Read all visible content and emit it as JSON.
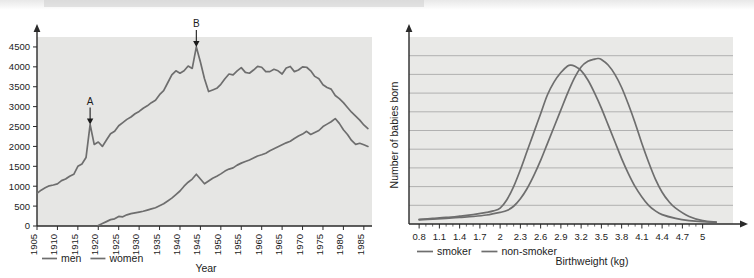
{
  "figure": {
    "name": "two-scanned-line-charts",
    "background_color": "#ffffff",
    "plot_background_color": "#e6e6e4",
    "line_color": "#6e6e6e",
    "grid_color": "#9a9a9a",
    "axis_color": "#2a2a2a"
  },
  "chart_data": [
    {
      "type": "line",
      "name": "deaths-by-year-chart",
      "title": "",
      "xlabel": "Year",
      "ylabel": "",
      "xlim": [
        1905,
        1987
      ],
      "ylim": [
        0,
        4750
      ],
      "grid": false,
      "legend_position": "bottom-left",
      "xticks": [
        1905,
        1910,
        1915,
        1920,
        1925,
        1930,
        1935,
        1940,
        1945,
        1950,
        1955,
        1960,
        1965,
        1970,
        1975,
        1980,
        1985
      ],
      "xtick_labels": [
        "1905",
        "1910",
        "1915",
        "1920",
        "1925",
        "1930",
        "1935",
        "1940",
        "1945",
        "1950",
        "1955",
        "1960",
        "1965",
        "1970",
        "1975",
        "1980",
        "1985"
      ],
      "yticks": [
        0,
        500,
        1000,
        1500,
        2000,
        2500,
        3000,
        3500,
        4000,
        4500
      ],
      "ytick_labels": [
        "0",
        "500",
        "1000",
        "1500",
        "2000",
        "2500",
        "3000",
        "3500",
        "4000",
        "4500"
      ],
      "annotations": [
        {
          "label": "A",
          "x": 1918,
          "y": 2550
        },
        {
          "label": "B",
          "x": 1944,
          "y": 4500
        }
      ],
      "series": [
        {
          "name": "men",
          "legend_label": "men",
          "x": [
            1905,
            1906,
            1907,
            1908,
            1909,
            1910,
            1911,
            1912,
            1913,
            1914,
            1915,
            1916,
            1917,
            1918,
            1919,
            1920,
            1921,
            1922,
            1923,
            1924,
            1925,
            1926,
            1927,
            1928,
            1929,
            1930,
            1931,
            1932,
            1933,
            1934,
            1935,
            1936,
            1937,
            1938,
            1939,
            1940,
            1941,
            1942,
            1943,
            1944,
            1945,
            1946,
            1947,
            1948,
            1949,
            1950,
            1951,
            1952,
            1953,
            1954,
            1955,
            1956,
            1957,
            1958,
            1959,
            1960,
            1961,
            1962,
            1963,
            1964,
            1965,
            1966,
            1967,
            1968,
            1969,
            1970,
            1971,
            1972,
            1973,
            1974,
            1975,
            1976,
            1977,
            1978,
            1979,
            1980,
            1981,
            1982,
            1983,
            1984,
            1985,
            1986
          ],
          "y": [
            820,
            900,
            960,
            1010,
            1030,
            1060,
            1140,
            1180,
            1250,
            1300,
            1500,
            1560,
            1720,
            2550,
            2050,
            2110,
            2000,
            2160,
            2320,
            2380,
            2520,
            2600,
            2680,
            2740,
            2820,
            2880,
            2960,
            3020,
            3100,
            3160,
            3300,
            3400,
            3600,
            3800,
            3900,
            3840,
            3900,
            4020,
            3960,
            4500,
            4120,
            3700,
            3380,
            3420,
            3460,
            3560,
            3700,
            3820,
            3800,
            3900,
            3980,
            3860,
            3840,
            3920,
            4010,
            3990,
            3880,
            3880,
            3940,
            3900,
            3820,
            3970,
            4010,
            3880,
            3920,
            4000,
            3990,
            3900,
            3760,
            3700,
            3550,
            3480,
            3440,
            3280,
            3200,
            3100,
            2980,
            2860,
            2760,
            2660,
            2540,
            2450
          ]
        },
        {
          "name": "women",
          "legend_label": "women",
          "x": [
            1920,
            1921,
            1922,
            1923,
            1924,
            1925,
            1926,
            1927,
            1928,
            1929,
            1930,
            1931,
            1932,
            1933,
            1934,
            1935,
            1936,
            1937,
            1938,
            1939,
            1940,
            1941,
            1942,
            1943,
            1944,
            1945,
            1946,
            1947,
            1948,
            1949,
            1950,
            1951,
            1952,
            1953,
            1954,
            1955,
            1956,
            1957,
            1958,
            1959,
            1960,
            1961,
            1962,
            1963,
            1964,
            1965,
            1966,
            1967,
            1968,
            1969,
            1970,
            1971,
            1972,
            1973,
            1974,
            1975,
            1976,
            1977,
            1978,
            1979,
            1980,
            1981,
            1982,
            1983,
            1984,
            1985,
            1986
          ],
          "y": [
            10,
            60,
            110,
            160,
            180,
            240,
            230,
            280,
            310,
            330,
            350,
            370,
            400,
            430,
            460,
            510,
            560,
            630,
            700,
            790,
            880,
            1000,
            1100,
            1180,
            1300,
            1180,
            1060,
            1130,
            1200,
            1250,
            1310,
            1380,
            1430,
            1460,
            1530,
            1580,
            1620,
            1660,
            1710,
            1760,
            1790,
            1830,
            1890,
            1940,
            1990,
            2040,
            2090,
            2130,
            2200,
            2260,
            2310,
            2380,
            2300,
            2350,
            2400,
            2500,
            2560,
            2620,
            2700,
            2580,
            2420,
            2300,
            2150,
            2050,
            2080,
            2040,
            2000
          ]
        }
      ]
    },
    {
      "type": "line",
      "name": "birthweight-distribution-chart",
      "title": "",
      "xlabel": "Birthweight (kg)",
      "ylabel": "Number of babies born",
      "xlim": [
        0.65,
        5.45
      ],
      "ylim": [
        0,
        10
      ],
      "grid": true,
      "gridline_count": 9,
      "legend_position": "bottom-left",
      "xticks": [
        0.8,
        1.1,
        1.4,
        1.7,
        2,
        2.3,
        2.6,
        2.9,
        3.2,
        3.5,
        3.8,
        4.1,
        4.4,
        4.7,
        5
      ],
      "xtick_labels": [
        "0.8",
        "1.1",
        "1.4",
        "1.7",
        "2",
        "2.3",
        "2.6",
        "2.9",
        "3.2",
        "3.5",
        "3.8",
        "4.1",
        "4.4",
        "4.7",
        "5"
      ],
      "yticks": [],
      "ytick_labels": [],
      "series": [
        {
          "name": "smoker",
          "legend_label": "smoker",
          "peak_x": 3.05,
          "x": [
            0.8,
            1.0,
            1.2,
            1.4,
            1.6,
            1.8,
            1.9,
            2.0,
            2.1,
            2.2,
            2.3,
            2.4,
            2.5,
            2.6,
            2.7,
            2.8,
            2.9,
            3.0,
            3.05,
            3.1,
            3.2,
            3.3,
            3.4,
            3.5,
            3.6,
            3.7,
            3.8,
            3.9,
            4.0,
            4.1,
            4.2,
            4.3,
            4.4,
            4.6,
            4.8,
            5.0,
            5.2
          ],
          "y": [
            0.25,
            0.3,
            0.35,
            0.42,
            0.5,
            0.62,
            0.7,
            0.85,
            1.3,
            2.0,
            2.9,
            3.9,
            4.9,
            5.9,
            6.9,
            7.6,
            8.1,
            8.45,
            8.5,
            8.45,
            8.2,
            7.7,
            7.0,
            6.2,
            5.3,
            4.4,
            3.5,
            2.7,
            2.0,
            1.45,
            1.0,
            0.7,
            0.5,
            0.3,
            0.18,
            0.12,
            0.1
          ]
        },
        {
          "name": "non-smoker",
          "legend_label": "non-smoker",
          "peak_x": 3.42,
          "x": [
            0.8,
            1.0,
            1.2,
            1.4,
            1.6,
            1.8,
            2.0,
            2.1,
            2.2,
            2.3,
            2.4,
            2.5,
            2.6,
            2.7,
            2.8,
            2.9,
            3.0,
            3.1,
            3.2,
            3.3,
            3.4,
            3.45,
            3.5,
            3.6,
            3.7,
            3.8,
            3.9,
            4.0,
            4.1,
            4.2,
            4.3,
            4.4,
            4.5,
            4.6,
            4.8,
            5.0,
            5.2
          ],
          "y": [
            0.22,
            0.26,
            0.3,
            0.35,
            0.4,
            0.48,
            0.62,
            0.72,
            0.95,
            1.35,
            1.9,
            2.6,
            3.4,
            4.3,
            5.2,
            6.1,
            7.0,
            7.8,
            8.4,
            8.7,
            8.82,
            8.85,
            8.8,
            8.5,
            8.0,
            7.3,
            6.4,
            5.4,
            4.3,
            3.3,
            2.4,
            1.7,
            1.2,
            0.85,
            0.4,
            0.18,
            0.1
          ]
        }
      ]
    }
  ],
  "left_chart_labels": {
    "xaxis_title": "Year",
    "legend": [
      {
        "label": "men"
      },
      {
        "label": "women"
      }
    ],
    "annotation_a": "A",
    "annotation_b": "B"
  },
  "right_chart_labels": {
    "xaxis_title": "Birthweight (kg)",
    "yaxis_title": "Number of babies born",
    "legend": [
      {
        "label": "smoker"
      },
      {
        "label": "non-smoker"
      }
    ]
  }
}
